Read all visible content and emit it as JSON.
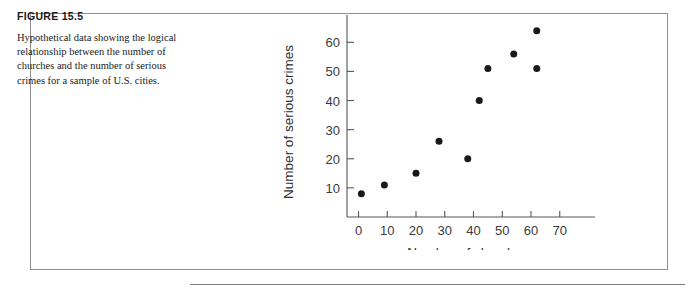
{
  "figure": {
    "number_label": "FIGURE 15.5",
    "caption": "Hypothetical data showing the logical relationship between the number of churches and the number of serious crimes for a sample of U.S. cities."
  },
  "colors": {
    "dot": "#191919",
    "axis": "#55565a",
    "frame": "#8e8e93",
    "text": "#1a1a1a"
  },
  "chart_data": {
    "type": "scatter",
    "title": "",
    "xlabel": "Number of churches",
    "ylabel": "Number of serious crimes",
    "xlim": [
      -4,
      76
    ],
    "ylim": [
      0,
      68
    ],
    "grid": false,
    "legend": null,
    "xticks": [
      0,
      10,
      20,
      30,
      40,
      50,
      60,
      70
    ],
    "yticks": [
      10,
      20,
      30,
      40,
      50,
      60
    ],
    "x": [
      1,
      9,
      20,
      28,
      38,
      42,
      45,
      54,
      62,
      62
    ],
    "y": [
      8,
      11,
      15,
      26,
      20,
      40,
      51,
      56,
      64,
      51
    ],
    "points": [
      {
        "x": 1,
        "y": 8
      },
      {
        "x": 9,
        "y": 11
      },
      {
        "x": 20,
        "y": 15
      },
      {
        "x": 28,
        "y": 26
      },
      {
        "x": 38,
        "y": 20
      },
      {
        "x": 42,
        "y": 40
      },
      {
        "x": 45,
        "y": 51
      },
      {
        "x": 54,
        "y": 56
      },
      {
        "x": 62,
        "y": 64
      },
      {
        "x": 62,
        "y": 51
      }
    ]
  }
}
